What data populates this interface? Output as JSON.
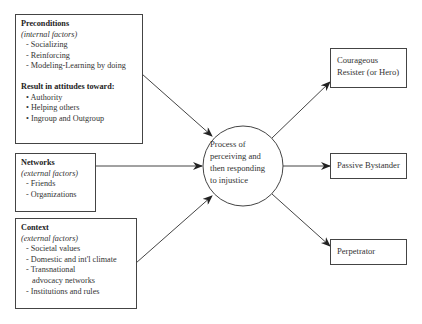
{
  "diagram": {
    "inputs": [
      {
        "title": "Preconditions",
        "subtitle": "(internal factors)",
        "items": [
          "- Socializing",
          "- Reinforcing",
          "- Modeling-Learning by doing"
        ],
        "result_title": "Result in attitudes toward:",
        "result_items": [
          "• Authority",
          "• Helping others",
          "• Ingroup and Outgroup"
        ]
      },
      {
        "title": "Networks",
        "subtitle": "(external factors)",
        "items": [
          "- Friends",
          "- Organizations"
        ]
      },
      {
        "title": "Context",
        "subtitle": "(external factors)",
        "items": [
          "- Societal values",
          "- Domestic and int'l climate",
          "- Transnational",
          "advocacy networks",
          "- Institutions and rules"
        ]
      }
    ],
    "process": {
      "lines": [
        "Process of",
        "perceiving and",
        "then responding",
        "to injustice"
      ]
    },
    "outcomes": [
      {
        "lines": [
          "Courageous",
          "Resister (or Hero)"
        ]
      },
      {
        "lines": [
          "Passive Bystander"
        ]
      },
      {
        "lines": [
          "Perpetrator"
        ]
      }
    ],
    "colors": {
      "line": "#444444",
      "text": "#333333",
      "background": "#ffffff"
    }
  }
}
